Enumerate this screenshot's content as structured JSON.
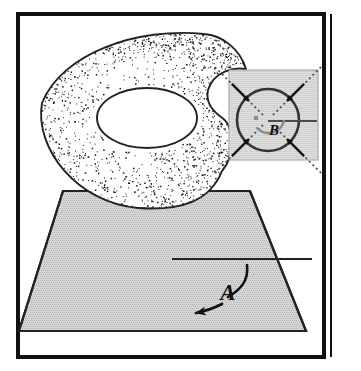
{
  "figure": {
    "title": "",
    "frame": {
      "border_color": "#111111",
      "background_color": "#ffffff",
      "border_width_px": 4,
      "rect": {
        "x": 18,
        "y": 14,
        "width": 306,
        "height": 343
      },
      "right_rule_x": 331,
      "right_rule_color": "#111111"
    },
    "labels": [
      {
        "id": "A",
        "text": "A",
        "x": 228,
        "y": 300,
        "role": "plane-annotation-label"
      },
      {
        "id": "B",
        "text": "B",
        "x": 274,
        "y": 135,
        "role": "inset-angle-label"
      }
    ],
    "torus": {
      "name": "stippled-torus",
      "fill_color": "#ffffff",
      "stroke_color": "#222222",
      "stipple_color": "#1a1a1a",
      "stipple_density": "graded",
      "outer_center": {
        "x": 148,
        "y": 115
      },
      "outer_rx": 110,
      "outer_ry": 82,
      "hole_center": {
        "x": 147,
        "y": 118
      },
      "hole_rx": 50,
      "hole_ry": 30
    },
    "plane": {
      "name": "ground-plane-parallelogram",
      "fill_color": "#d6d6d6",
      "stroke_color": "#222222",
      "points": "63,191 250,191 306,331 19,331",
      "interior_line": {
        "x1": 172,
        "y1": 259,
        "x2": 312,
        "y2": 259
      }
    },
    "annotation_a": {
      "name": "curved-arrow-a",
      "color": "#111111",
      "description": "curved arrow pointing left-downward on the plane",
      "curve": "M247,265 C249,281 240,290 228,297",
      "tail": "M222,304 C214,308 206,311 196,313"
    },
    "inset": {
      "name": "detail-inset-box",
      "background_color": "#dededd",
      "border_color": "#9a9a9a",
      "rect": {
        "x": 229,
        "y": 70,
        "width": 89,
        "height": 90
      },
      "circle": {
        "name": "cross-section-circle",
        "center": {
          "x": 268,
          "y": 120
        },
        "r": 31,
        "stroke_color": "#333333",
        "fill_color": "none"
      },
      "reference_line": {
        "x1": 268,
        "y1": 121,
        "x2": 317,
        "y2": 121,
        "color": "#4a4a4a"
      },
      "angle_arc": {
        "color": "#8a8a8a",
        "label": "B"
      },
      "arrows": [
        {
          "id": "arrow-nw",
          "angle_deg": 225,
          "direction": "inward"
        },
        {
          "id": "arrow-ne",
          "angle_deg": 315,
          "direction": "inward"
        },
        {
          "id": "arrow-sw",
          "angle_deg": 135,
          "direction": "inward"
        },
        {
          "id": "arrow-se",
          "angle_deg": 45,
          "direction": "inward"
        }
      ],
      "arrow_color": "#111111",
      "dotted_line_color": "#444444"
    }
  }
}
